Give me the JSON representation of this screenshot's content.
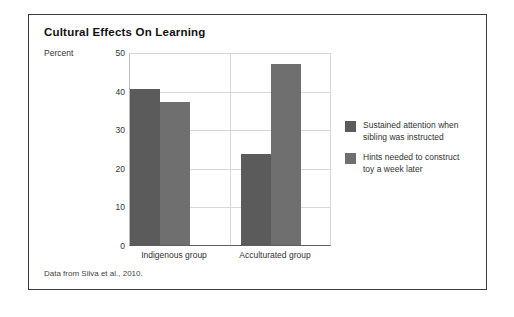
{
  "figure": {
    "title": "Cultural Effects On Learning",
    "footnote": "Data from Silva et al., 2010."
  },
  "chart_data": {
    "type": "bar",
    "title": "Cultural Effects On Learning",
    "xlabel": "",
    "ylabel": "Percent",
    "ylim": [
      0,
      50
    ],
    "yticks": [
      0,
      10,
      20,
      30,
      40,
      50
    ],
    "ytick_labels": [
      "0",
      "10",
      "20",
      "30",
      "40",
      "50"
    ],
    "grid": true,
    "legend_position": "right",
    "categories": [
      "Indigenous group",
      "Acculturated group"
    ],
    "series": [
      {
        "name": "Sustained attention when sibling was instructed",
        "name_line1": "Sustained attention when",
        "name_line2": "sibling was instructed",
        "color": "#5b5b5b",
        "values": [
          40.5,
          23.5
        ]
      },
      {
        "name": "Hints needed to construct toy a week later",
        "name_line1": "Hints needed to construct",
        "name_line2": "toy a week later",
        "color": "#6f6f6f",
        "values": [
          37.0,
          47.0
        ]
      }
    ],
    "source": "Data from Silva et al., 2010."
  }
}
